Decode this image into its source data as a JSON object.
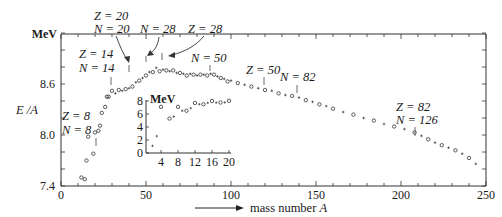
{
  "chart_data": [
    {
      "type": "scatter",
      "title": "",
      "xlabel": "mass number A",
      "ylabel": "E / A",
      "yunit": "MeV",
      "xlim": [
        0,
        250
      ],
      "ylim": [
        7.4,
        9.2
      ],
      "xticks": [
        0,
        50,
        100,
        150,
        200,
        250
      ],
      "yticks": [
        7.4,
        8.0,
        8.6
      ],
      "grid": false,
      "markers": "open circles (even-even nuclei) and small crosses (odd-A nuclei)",
      "series": [
        {
          "name": "binding energy per nucleon",
          "x": [
            12,
            14,
            15,
            16,
            19,
            20,
            22,
            23,
            24,
            26,
            27,
            28,
            30,
            32,
            34,
            36,
            38,
            40,
            42,
            44,
            46,
            48,
            50,
            52,
            54,
            56,
            58,
            60,
            62,
            64,
            66,
            68,
            70,
            72,
            74,
            76,
            78,
            80,
            82,
            84,
            86,
            88,
            90,
            92,
            94,
            96,
            98,
            100,
            104,
            108,
            112,
            116,
            120,
            124,
            128,
            132,
            136,
            140,
            144,
            148,
            152,
            156,
            160,
            166,
            172,
            178,
            184,
            190,
            196,
            202,
            208,
            212,
            216,
            220,
            224,
            228,
            232,
            236,
            240,
            244
          ],
          "y": [
            7.5,
            7.48,
            7.7,
            7.98,
            7.78,
            8.03,
            8.05,
            8.11,
            8.26,
            8.33,
            8.45,
            8.45,
            8.52,
            8.49,
            8.53,
            8.52,
            8.54,
            8.55,
            8.57,
            8.62,
            8.64,
            8.67,
            8.7,
            8.74,
            8.74,
            8.79,
            8.75,
            8.77,
            8.76,
            8.75,
            8.76,
            8.73,
            8.73,
            8.72,
            8.7,
            8.72,
            8.71,
            8.7,
            8.71,
            8.71,
            8.7,
            8.72,
            8.71,
            8.69,
            8.67,
            8.66,
            8.63,
            8.64,
            8.61,
            8.59,
            8.57,
            8.55,
            8.53,
            8.52,
            8.49,
            8.47,
            8.46,
            8.44,
            8.41,
            8.39,
            8.36,
            8.34,
            8.31,
            8.27,
            8.24,
            8.2,
            8.17,
            8.13,
            8.1,
            8.07,
            8.03,
            7.99,
            7.95,
            7.91,
            7.88,
            7.85,
            7.82,
            7.78,
            7.73,
            7.66
          ]
        }
      ],
      "annotations": [
        {
          "label": [
            "Z = 8",
            "N = 8"
          ],
          "x": 16
        },
        {
          "label": [
            "Z = 14",
            "N = 14"
          ],
          "x": 28
        },
        {
          "label": [
            "Z = 20",
            "N = 20"
          ],
          "x": 40
        },
        {
          "label": [
            "N = 28"
          ],
          "x": 50
        },
        {
          "label": [
            "Z = 28"
          ],
          "x": 58
        },
        {
          "label": [
            "N = 50"
          ],
          "x": 88
        },
        {
          "label": [
            "Z = 50"
          ],
          "x": 120
        },
        {
          "label": [
            "N = 82"
          ],
          "x": 138
        },
        {
          "label": [
            "Z = 82",
            "N = 126"
          ],
          "x": 208
        }
      ]
    },
    {
      "type": "scatter",
      "title": "inset: light nuclei",
      "xlabel": "",
      "ylabel": "",
      "yunit": "MeV",
      "xlim": [
        0,
        20
      ],
      "ylim": [
        0,
        8
      ],
      "xticks": [
        4,
        8,
        12,
        16,
        20
      ],
      "yticks": [
        0,
        2,
        4,
        6,
        8
      ],
      "series": [
        {
          "name": "binding energy per nucleon (A <= 20)",
          "x": [
            2,
            3,
            4,
            6,
            7,
            8,
            9,
            10,
            11,
            12,
            13,
            14,
            15,
            16,
            17,
            18,
            19,
            20
          ],
          "y": [
            1.1,
            2.6,
            7.1,
            5.3,
            5.6,
            7.1,
            6.5,
            6.5,
            6.9,
            7.7,
            7.5,
            7.5,
            7.7,
            8.0,
            7.75,
            7.77,
            7.78,
            8.03
          ]
        }
      ]
    }
  ],
  "main": {
    "y_unit": "MeV",
    "y_label": "E /A",
    "x_label_prefix": "mass number ",
    "x_label_var": "A",
    "x_tick_labels": [
      "0",
      "50",
      "100",
      "150",
      "200",
      "250"
    ],
    "y_tick_labels": [
      "7.4",
      "8.0",
      "8.6"
    ]
  },
  "inset": {
    "y_unit": "MeV",
    "x_tick_labels": [
      "4",
      "8",
      "12",
      "16",
      "20"
    ],
    "y_tick_labels": [
      "0",
      "2",
      "4",
      "6",
      "8"
    ]
  },
  "labels": {
    "z8": "Z = 8",
    "n8": "N = 8",
    "z14": "Z = 14",
    "n14": "N = 14",
    "z20": "Z = 20",
    "n20": "N = 20",
    "n28": "N = 28",
    "z28": "Z = 28",
    "n50": "N = 50",
    "z50": "Z = 50",
    "n82": "N = 82",
    "z82": "Z = 82",
    "n126": "N = 126"
  }
}
